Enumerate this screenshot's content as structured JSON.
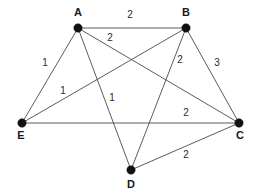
{
  "figure": {
    "type": "weighted-undirected-graph",
    "background_color": "#ffffff",
    "node_color": "#111111",
    "edge_color": "#4a4a4a",
    "label_color": "#1a1a1a"
  },
  "nodes": [
    {
      "id": "A",
      "label": "A",
      "x": 78,
      "y": 28,
      "label_x": 78,
      "label_y": 13,
      "radius": 4.2
    },
    {
      "id": "B",
      "label": "B",
      "x": 186,
      "y": 28,
      "label_x": 186,
      "label_y": 13,
      "radius": 4.2
    },
    {
      "id": "C",
      "label": "C",
      "x": 239,
      "y": 123,
      "label_x": 240,
      "label_y": 136,
      "radius": 4.2
    },
    {
      "id": "D",
      "label": "D",
      "x": 131,
      "y": 170,
      "label_x": 131,
      "label_y": 185,
      "radius": 4.2
    },
    {
      "id": "E",
      "label": "E",
      "x": 22,
      "y": 123,
      "label_x": 21,
      "label_y": 136,
      "radius": 4.2
    }
  ],
  "edges": [
    {
      "id": "AB",
      "from": "A",
      "to": "B",
      "weight": "2",
      "label_x": 130,
      "label_y": 15
    },
    {
      "id": "AC",
      "from": "A",
      "to": "C",
      "weight": "2",
      "label_x": 110,
      "label_y": 38
    },
    {
      "id": "AE",
      "from": "A",
      "to": "E",
      "weight": "1",
      "label_x": 45,
      "label_y": 63
    },
    {
      "id": "AD",
      "from": "A",
      "to": "D",
      "weight": "1",
      "label_x": 112,
      "label_y": 98
    },
    {
      "id": "BE",
      "from": "B",
      "to": "E",
      "weight": "1",
      "label_x": 63,
      "label_y": 91
    },
    {
      "id": "BD",
      "from": "B",
      "to": "D",
      "weight": "2",
      "label_x": 180,
      "label_y": 60
    },
    {
      "id": "BC",
      "from": "B",
      "to": "C",
      "weight": "3",
      "label_x": 217,
      "label_y": 63
    },
    {
      "id": "EC",
      "from": "E",
      "to": "C",
      "weight": "2",
      "label_x": 186,
      "label_y": 113
    },
    {
      "id": "DC",
      "from": "D",
      "to": "C",
      "weight": "2",
      "label_x": 186,
      "label_y": 155
    }
  ],
  "chart_data": {
    "type": "diagram",
    "title": "",
    "vertices": [
      "A",
      "B",
      "C",
      "D",
      "E"
    ],
    "edge_list": [
      {
        "endpoints": [
          "A",
          "B"
        ],
        "weight": 2
      },
      {
        "endpoints": [
          "A",
          "C"
        ],
        "weight": 2
      },
      {
        "endpoints": [
          "A",
          "E"
        ],
        "weight": 1
      },
      {
        "endpoints": [
          "A",
          "D"
        ],
        "weight": 1
      },
      {
        "endpoints": [
          "B",
          "E"
        ],
        "weight": 1
      },
      {
        "endpoints": [
          "B",
          "D"
        ],
        "weight": 2
      },
      {
        "endpoints": [
          "B",
          "C"
        ],
        "weight": 3
      },
      {
        "endpoints": [
          "E",
          "C"
        ],
        "weight": 2
      },
      {
        "endpoints": [
          "D",
          "C"
        ],
        "weight": 2
      }
    ]
  }
}
